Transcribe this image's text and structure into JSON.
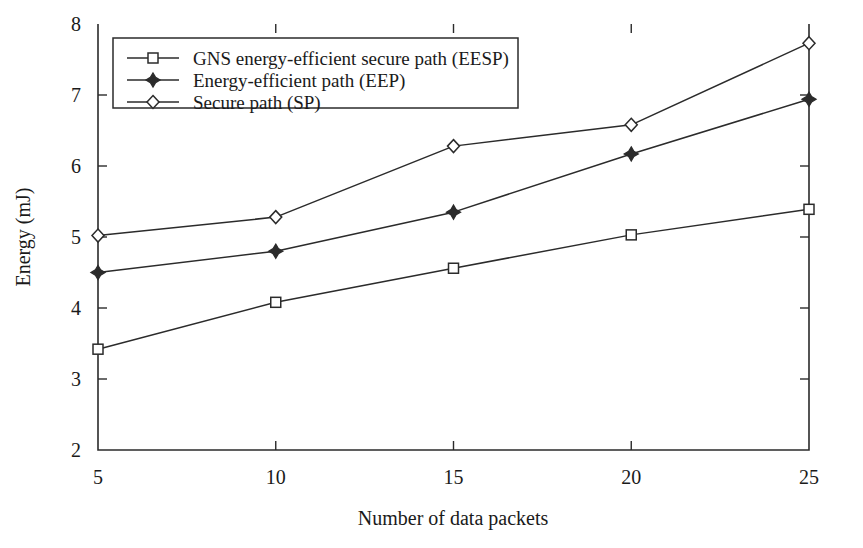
{
  "chart_data": {
    "type": "line",
    "title": "",
    "xlabel": "Number of data packets",
    "ylabel": "Energy (mJ)",
    "x": [
      5,
      10,
      15,
      20,
      25
    ],
    "xticklabels": [
      "5",
      "10",
      "15",
      "20",
      "25"
    ],
    "yticklabels": [
      "2",
      "3",
      "4",
      "5",
      "6",
      "7",
      "8"
    ],
    "yticks": [
      2,
      3,
      4,
      5,
      6,
      7,
      8
    ],
    "xlim": [
      5,
      25
    ],
    "ylim": [
      2,
      8
    ],
    "grid": false,
    "legend_position": "upper-left-inside",
    "series": [
      {
        "name": "GNS energy-efficient secure path (EESP)",
        "marker": "open-square",
        "values": [
          3.42,
          4.08,
          4.56,
          5.03,
          5.39
        ]
      },
      {
        "name": "Energy-efficient path (EEP)",
        "marker": "filled-diamond",
        "values": [
          4.5,
          4.8,
          5.35,
          6.17,
          6.94
        ]
      },
      {
        "name": "Secure path (SP)",
        "marker": "open-diamond",
        "values": [
          5.02,
          5.28,
          6.28,
          6.58,
          7.73
        ]
      }
    ]
  },
  "colors": {
    "ink": "#2b2b2b",
    "background": "#ffffff",
    "marker_fill": "#ffffff"
  },
  "legend": {
    "entries": [
      "GNS energy-efficient secure path (EESP)",
      "Energy-efficient path (EEP)",
      "Secure path (SP)"
    ]
  }
}
